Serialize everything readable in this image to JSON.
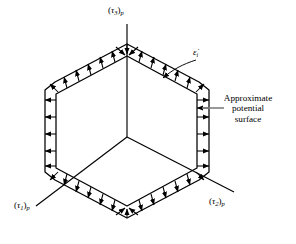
{
  "figure": {
    "background_color": "#ffffff",
    "line_color": "#000000",
    "axes": [
      {
        "id": "tau1",
        "tau": "τ",
        "index": "1",
        "p": "p",
        "position": "bottom-left"
      },
      {
        "id": "tau2",
        "tau": "τ",
        "index": "2",
        "p": "p",
        "position": "bottom-right"
      },
      {
        "id": "tau3",
        "tau": "τ",
        "index": "3",
        "p": "p",
        "position": "top"
      }
    ],
    "labels": {
      "tau3": {
        "open": "(",
        "tau": "τ",
        "sub": "3",
        "close": ")",
        "p": "p"
      },
      "tau1": {
        "open": "(",
        "tau": "τ",
        "sub": "1",
        "close": ")",
        "p": "p"
      },
      "tau2": {
        "open": "(",
        "tau": "τ",
        "sub": "2",
        "close": ")",
        "p": "p"
      },
      "strain_rate": {
        "symbol": "ε̇",
        "sub": "i"
      },
      "callout": {
        "line1": "Approximate",
        "line2": "potential",
        "line3": "surface"
      }
    },
    "geometry": {
      "shape": "hexagon",
      "style": "double-line band with normal arrows",
      "corner": "chamfered",
      "center": [
        127,
        137
      ],
      "outer_vertices": [
        [
          127,
          48
        ],
        [
          205,
          90
        ],
        [
          205,
          175
        ],
        [
          127,
          214
        ],
        [
          47,
          175
        ],
        [
          47,
          90
        ]
      ],
      "arrow_direction": "outward normal to surface"
    }
  }
}
